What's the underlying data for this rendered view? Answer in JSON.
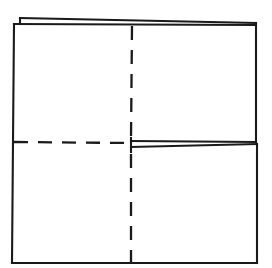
{
  "canvas": {
    "width": 272,
    "height": 268,
    "background": "#ffffff"
  },
  "figure": {
    "ink_color": "#1a1a1a",
    "stroke_width": 2.1,
    "dash_pattern": "14 10"
  },
  "geometry": {
    "square": {
      "top_left": [
        14,
        24
      ],
      "top_right": [
        256,
        23
      ],
      "bottom_right": [
        257,
        263
      ],
      "bottom_left": [
        12,
        263
      ]
    },
    "center": [
      131,
      143
    ],
    "flap_top_left": {
      "corner": [
        20,
        18
      ],
      "step_bottom": [
        20,
        24
      ],
      "ridge_end": [
        256,
        23
      ]
    },
    "wedge_middle_right": {
      "tip": [
        131,
        143
      ],
      "upper_end": [
        256,
        142
      ],
      "lower_end": [
        257,
        144
      ],
      "tick_top": [
        131,
        138
      ],
      "tick_bottom": [
        131,
        152
      ]
    }
  },
  "strokes": [
    {
      "name": "outer-left-edge",
      "type": "solid",
      "points": "14,24 13,142 12,263"
    },
    {
      "name": "outer-bottom-edge",
      "type": "solid",
      "points": "12,263 257,263"
    },
    {
      "name": "outer-right-edge-upper",
      "type": "solid",
      "points": "256,23 256,142"
    },
    {
      "name": "outer-right-edge-lower",
      "type": "solid",
      "points": "257,144 257,263"
    },
    {
      "name": "outer-top-edge",
      "type": "solid",
      "points": "14,24 256,25"
    },
    {
      "name": "flap-ridge-top",
      "type": "solid",
      "points": "20,18 256,23"
    },
    {
      "name": "flap-step-left",
      "type": "solid",
      "points": "20,18 20,24"
    },
    {
      "name": "wedge-upper-line",
      "type": "solid",
      "points": "131,141 256,142"
    },
    {
      "name": "wedge-lower-line",
      "type": "solid",
      "points": "131,147 257,144"
    },
    {
      "name": "wedge-tip-tick",
      "type": "solid",
      "points": "131,138 131,152"
    },
    {
      "name": "crease-vertical-upper",
      "type": "dashed",
      "points": "132,26 131,139"
    },
    {
      "name": "crease-vertical-lower",
      "type": "dashed",
      "points": "131,154 131,263"
    },
    {
      "name": "crease-horizontal-left",
      "type": "dashed",
      "points": "14,142 130,143"
    }
  ],
  "labels": {
    "caption": "",
    "legend_solid": "cut / edge line",
    "legend_dashed": "fold / crease line"
  }
}
